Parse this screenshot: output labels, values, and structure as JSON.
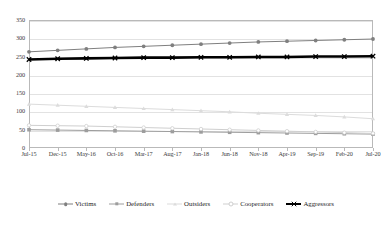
{
  "chart_data": {
    "type": "line",
    "title": "",
    "subtitle": "",
    "xlabel": "",
    "ylabel": "",
    "ylim": [
      0,
      350
    ],
    "yticks": [
      0,
      50,
      100,
      150,
      200,
      250,
      300,
      350
    ],
    "ytick_labels": [
      "0",
      "50",
      "100",
      "150",
      "200",
      "250",
      "300",
      "350"
    ],
    "grid": true,
    "legend_position": "bottom",
    "categories": [
      "Jul-15",
      "Dec-15",
      "May-16",
      "Oct-16",
      "Mar-17",
      "Aug-17",
      "Jan-18",
      "Jun-18",
      "Nov-18",
      "Apr-19",
      "Sep-19",
      "Feb-20",
      "Jul-20"
    ],
    "series": [
      {
        "name": "Victims",
        "color": "#7f7f7f",
        "marker": "circle",
        "line_width": 1,
        "values": [
          263,
          267,
          271,
          275,
          278,
          281,
          284,
          287,
          290,
          292,
          294,
          296,
          298
        ]
      },
      {
        "name": "Defenders",
        "color": "#9d9d9d",
        "marker": "square",
        "line_width": 1,
        "values": [
          50,
          49,
          48,
          47,
          46,
          45,
          44,
          43,
          42,
          41,
          40,
          39,
          38
        ]
      },
      {
        "name": "Outsiders",
        "color": "#dcdcdc",
        "marker": "triangle",
        "line_width": 1,
        "values": [
          120,
          117,
          114,
          111,
          108,
          105,
          102,
          99,
          95,
          92,
          89,
          85,
          80
        ]
      },
      {
        "name": "Cooperators",
        "color": "#cfcfcf",
        "marker": "circle-open",
        "line_width": 1,
        "values": [
          62,
          61,
          60,
          58,
          56,
          54,
          52,
          50,
          48,
          46,
          44,
          42,
          40
        ]
      },
      {
        "name": "Aggressors",
        "color": "#000000",
        "marker": "cross",
        "line_width": 2.6,
        "values": [
          242,
          244,
          245,
          246,
          247,
          247,
          248,
          248,
          249,
          249,
          250,
          250,
          251
        ]
      }
    ]
  }
}
